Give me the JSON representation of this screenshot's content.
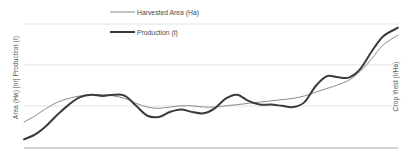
{
  "chart_data": {
    "type": "line",
    "title": "",
    "subtitle": "",
    "xlabel": "",
    "ylabel": "Area (Ha) [or] Production (t)",
    "y2label": "Crop Yield (t/Ha)",
    "grid": true,
    "gridlines_y": 4,
    "legend_position": "top-center",
    "x_tick_labels": [],
    "y_tick_labels": [],
    "y2_tick_labels": [],
    "xlim": [
      0,
      100
    ],
    "ylim": [
      0,
      100
    ],
    "series": [
      {
        "name": "Harvested Area (Ha)",
        "color": "#8a8a8a",
        "line_width": 1.0,
        "axis": "left",
        "x": [
          0,
          3,
          6,
          9,
          12,
          15,
          18,
          21,
          24,
          27,
          30,
          33,
          36,
          39,
          42,
          45,
          48,
          51,
          54,
          57,
          60,
          63,
          66,
          69,
          72,
          75,
          78,
          81,
          84,
          87,
          90,
          93,
          96,
          100
        ],
        "values": [
          21,
          26,
          32,
          37,
          40,
          42,
          43,
          43,
          42,
          40,
          36,
          33,
          32,
          33,
          34,
          34,
          33,
          33,
          34,
          35,
          36,
          37,
          38,
          39,
          40,
          42,
          45,
          48,
          51,
          55,
          62,
          72,
          83,
          91
        ]
      },
      {
        "name": "Production (t)",
        "color": "#3a3a3a",
        "line_width": 2.0,
        "axis": "left",
        "x": [
          0,
          3,
          6,
          9,
          12,
          15,
          18,
          21,
          24,
          27,
          30,
          33,
          36,
          39,
          42,
          45,
          48,
          51,
          54,
          57,
          60,
          63,
          66,
          69,
          72,
          75,
          78,
          81,
          84,
          87,
          90,
          93,
          96,
          100
        ],
        "values": [
          7,
          11,
          18,
          27,
          35,
          41,
          43,
          42,
          43,
          42,
          34,
          26,
          25,
          29,
          31,
          29,
          28,
          32,
          40,
          43,
          38,
          35,
          35,
          34,
          33,
          37,
          50,
          58,
          57,
          57,
          64,
          78,
          90,
          97
        ]
      }
    ]
  },
  "legend": {
    "items": [
      {
        "label": "Harvested Area (Ha)",
        "color": "#8a8a8a",
        "width": 1.0
      },
      {
        "label": "Production (t)",
        "color": "#3a3a3a",
        "width": 2.0
      }
    ]
  },
  "axes": {
    "left_title": "Area (Ha) [or] Production (t)",
    "right_title": "Crop Yield (t/Ha)"
  },
  "colors": {
    "background": "#ffffff",
    "grid": "#d9d9d9",
    "axis": "#9a9a9a",
    "harvested": "#8a8a8a",
    "production": "#3a3a3a",
    "text": "#555555"
  }
}
